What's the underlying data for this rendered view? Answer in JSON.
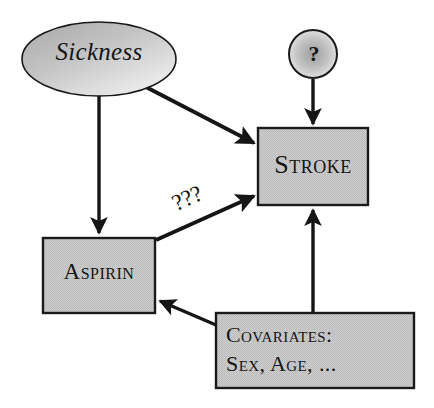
{
  "diagram": {
    "colors": {
      "node_fill": "#c9c9c9",
      "node_stroke": "#1a1a1a",
      "edge": "#151515",
      "background": "#ffffff",
      "text": "#151515"
    },
    "nodes": [
      {
        "id": "sickness",
        "label": "Sickness",
        "shape": "ellipse",
        "style": "italic",
        "fill": "gradient-gray"
      },
      {
        "id": "unknown-cause",
        "label": "?",
        "shape": "circle",
        "style": "bold",
        "fill": "radial-gradient-gray"
      },
      {
        "id": "stroke",
        "label": "Stroke",
        "shape": "rectangle",
        "style": "small-caps",
        "fill": "gray"
      },
      {
        "id": "aspirin",
        "label": "Aspirin",
        "shape": "rectangle",
        "style": "small-caps",
        "fill": "gray"
      },
      {
        "id": "covariates",
        "label_line1": "Covariates:",
        "label_line2": "Sex, Age, ...",
        "shape": "rectangle",
        "style": "small-caps",
        "fill": "gray"
      }
    ],
    "edges": [
      {
        "id": "sickness-to-aspirin",
        "from": "sickness",
        "to": "aspirin",
        "label": ""
      },
      {
        "id": "sickness-to-stroke",
        "from": "sickness",
        "to": "stroke",
        "label": ""
      },
      {
        "id": "unknown-to-stroke",
        "from": "unknown-cause",
        "to": "stroke",
        "label": ""
      },
      {
        "id": "aspirin-to-stroke",
        "from": "aspirin",
        "to": "stroke",
        "label": "???"
      },
      {
        "id": "covariates-to-aspirin",
        "from": "covariates",
        "to": "aspirin",
        "label": ""
      },
      {
        "id": "covariates-to-stroke",
        "from": "covariates",
        "to": "stroke",
        "label": ""
      }
    ],
    "edge_labels": {
      "aspirin_stroke": "???"
    }
  }
}
